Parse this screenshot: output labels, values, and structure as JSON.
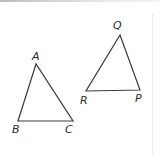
{
  "figure": {
    "stroke_color": "#3a3a3a",
    "triangles": [
      {
        "name": "ABC",
        "vertices": [
          {
            "label": "A",
            "x": 36,
            "y": 64,
            "label_x": 32,
            "label_y": 51
          },
          {
            "label": "B",
            "x": 18,
            "y": 121,
            "label_x": 12,
            "label_y": 124
          },
          {
            "label": "C",
            "x": 73,
            "y": 121,
            "label_x": 65,
            "label_y": 124
          }
        ]
      },
      {
        "name": "PQR",
        "vertices": [
          {
            "label": "Q",
            "x": 120,
            "y": 35,
            "label_x": 113,
            "label_y": 20
          },
          {
            "label": "R",
            "x": 86,
            "y": 91,
            "label_x": 80,
            "label_y": 95
          },
          {
            "label": "P",
            "x": 140,
            "y": 90,
            "label_x": 135,
            "label_y": 93
          }
        ]
      }
    ]
  }
}
